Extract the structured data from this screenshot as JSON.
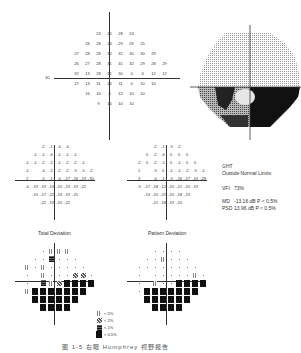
{
  "threshold_plot": {
    "axis_label": "30",
    "rows": [
      [
        "",
        "",
        "",
        "24",
        "25",
        "28",
        "24",
        "",
        "",
        ""
      ],
      [
        "",
        "",
        "26",
        "28",
        "24",
        "29",
        "29",
        "25",
        "",
        ""
      ],
      [
        "",
        "27",
        "28",
        "28",
        "30",
        "31",
        "30",
        "30",
        "29",
        ""
      ],
      [
        "",
        "26",
        "27",
        "28",
        "31",
        "31",
        "32",
        "29",
        "28",
        "29"
      ],
      [
        "",
        "32",
        "13",
        "28",
        "31",
        "30",
        "0",
        "4",
        "12",
        "12"
      ],
      [
        "",
        "27",
        "13",
        "11",
        "26",
        "11",
        "0",
        "10",
        "10",
        ""
      ],
      [
        "",
        "",
        "16",
        "16",
        "6",
        "12",
        "10",
        "10",
        "",
        ""
      ],
      [
        "",
        "",
        "",
        "9",
        "10",
        "10",
        "10",
        "",
        "",
        ""
      ]
    ]
  },
  "greyscale_map": {
    "axis_label": "30",
    "description": "Upper hemifield light stipple; inferior hemifield dense dark defect, darker nasally"
  },
  "total_deviation_values": {
    "rows": [
      [
        "",
        "",
        "",
        "-2",
        "-1",
        "-4",
        "-4",
        "",
        "",
        ""
      ],
      [
        "",
        "",
        "-1",
        "-1",
        "-6",
        "-1",
        "-1",
        "-1",
        "",
        ""
      ],
      [
        "",
        "-1",
        "-1",
        "-2",
        "-2",
        "-1",
        "-2",
        "-2",
        "-1",
        ""
      ],
      [
        "",
        "-1",
        "",
        "-4",
        "-2",
        "-2",
        "-2",
        "-3",
        "-5",
        "-2"
      ],
      [
        "",
        "2",
        "",
        "-5",
        "-1",
        "-4",
        "-27",
        "-26",
        "-23",
        "-30"
      ],
      [
        "",
        "-4",
        "-19",
        "-19",
        "-13",
        "-20",
        "-23",
        "-19",
        "-22",
        ""
      ],
      [
        "",
        "",
        "-15",
        "-17",
        "-22",
        "-24",
        "-19",
        "-25",
        "",
        ""
      ],
      [
        "",
        "",
        "",
        "-22",
        "-19",
        "-20",
        "-22",
        "",
        "",
        ""
      ]
    ]
  },
  "pattern_deviation_values": {
    "rows": [
      [
        "",
        "",
        "",
        "-2",
        "-1",
        "-3",
        "-2",
        "",
        "",
        ""
      ],
      [
        "",
        "",
        "0",
        "-2",
        "-6",
        "0",
        "0",
        "0",
        "",
        ""
      ],
      [
        "",
        "-2",
        "0",
        "-2",
        "-1",
        "0",
        "-1",
        "0",
        "0",
        ""
      ],
      [
        "",
        "1",
        "",
        "-3",
        "0",
        "-1",
        "-1",
        "-2",
        "-3",
        "-1"
      ],
      [
        "",
        "3",
        "",
        "-4",
        "-1",
        "-3",
        "-26",
        "-27",
        "-19",
        "-28"
      ],
      [
        "",
        "-3",
        "-17",
        "-18",
        "-12",
        "-20",
        "-21",
        "-20",
        "-19",
        ""
      ],
      [
        "",
        "",
        "-14",
        "-20",
        "-21",
        "-20",
        "-18",
        "-23",
        "",
        ""
      ],
      [
        "",
        "",
        "",
        "-21",
        "-18",
        "-19",
        "-20",
        "",
        "",
        ""
      ]
    ]
  },
  "total_deviation_prob": {
    "title": "Total Deviation",
    "rows": [
      [
        "",
        "",
        "",
        ".",
        "p5",
        "p5",
        "p5",
        "",
        "",
        ""
      ],
      [
        "",
        "",
        ".",
        ".",
        "p1",
        ".",
        ".",
        ".",
        "",
        ""
      ],
      [
        "",
        "p5",
        ".",
        "p5",
        ".",
        ".",
        ".",
        ".",
        ".",
        ""
      ],
      [
        "",
        ".",
        "",
        "p5",
        ".",
        ".",
        ".",
        "p2",
        "p2",
        "."
      ],
      [
        "",
        ".",
        "",
        "p1",
        "p5",
        "p2",
        "p05",
        "p05",
        "p05",
        "p05"
      ],
      [
        "",
        "p5",
        "p05",
        "p05",
        "p05",
        "p05",
        "p05",
        "p05",
        "p05",
        ""
      ],
      [
        "",
        "",
        "p05",
        "p05",
        "p05",
        "p05",
        "p05",
        "p05",
        "",
        ""
      ],
      [
        "",
        "",
        "",
        "p05",
        "p05",
        "p05",
        "p05",
        "",
        "",
        ""
      ]
    ]
  },
  "pattern_deviation_prob": {
    "title": "Pattern Deviation",
    "rows": [
      [
        "",
        "",
        "",
        ".",
        ".",
        ".",
        ".",
        "",
        "",
        ""
      ],
      [
        "",
        "",
        ".",
        ".",
        "p5",
        ".",
        ".",
        ".",
        "",
        ""
      ],
      [
        "",
        ".",
        ".",
        ".",
        ".",
        ".",
        ".",
        ".",
        ".",
        ""
      ],
      [
        "",
        ".",
        "",
        ".",
        ".",
        ".",
        ".",
        ".",
        "p5",
        "."
      ],
      [
        "",
        ".",
        "",
        "p5",
        ".",
        ".",
        "p05",
        "p05",
        "p05",
        "p05"
      ],
      [
        "",
        ".",
        "p05",
        "p05",
        "p05",
        "p05",
        "p05",
        "p05",
        "p05",
        ""
      ],
      [
        "",
        "",
        "p05",
        "p05",
        "p05",
        "p05",
        "p05",
        "p05",
        "",
        ""
      ],
      [
        "",
        "",
        "",
        "p05",
        "p05",
        "p05",
        "p05",
        "",
        "",
        ""
      ]
    ]
  },
  "stats": {
    "ght_label": "GHT",
    "ght_value": "Outside Normal Limits",
    "vfi_label": "VFI",
    "vfi_value": "73%",
    "md_label": "MD",
    "md_value": "-13.16 dB  P < 0.5%",
    "psd_label": "PSD",
    "psd_value": "13.96 dB  P < 0.5%"
  },
  "legend": [
    {
      "symbol": "p5",
      "label": "< 5%"
    },
    {
      "symbol": "p2",
      "label": "< 2%"
    },
    {
      "symbol": "p1",
      "label": "< 1%"
    },
    {
      "symbol": "p05",
      "label": "< 0.5%"
    }
  ],
  "caption": "图 1-5  右眼 Humphrey 视野报告"
}
